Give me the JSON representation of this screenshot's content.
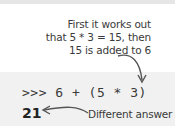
{
  "annotation_top": {
    "lines": [
      "First it works out",
      "that 5 * 3 = 15, then",
      "15 is added to 6"
    ]
  },
  "code": {
    "prompt": ">>>",
    "expression": "6 + (5 * 3)",
    "output": "21"
  },
  "annotation_bottom": {
    "label": "Different answer"
  },
  "colors": {
    "arrow": "#555555",
    "code_bg": "#f1f1f1",
    "text": "#3a3a3a"
  }
}
